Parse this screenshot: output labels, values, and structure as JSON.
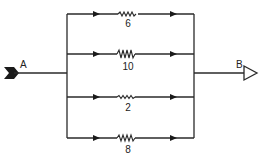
{
  "diagram": {
    "type": "parallel-resistor-network",
    "terminals": {
      "input": {
        "label": "A"
      },
      "output": {
        "label": "B"
      }
    },
    "branches": [
      {
        "resistance": "6"
      },
      {
        "resistance": "10"
      },
      {
        "resistance": "2"
      },
      {
        "resistance": "8"
      }
    ],
    "colors": {
      "stroke": "#2a2a2a",
      "background": "#ffffff"
    }
  }
}
